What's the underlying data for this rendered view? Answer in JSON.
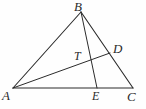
{
  "figure": {
    "kind": "geometry-diagram",
    "width": 146,
    "height": 109,
    "background_color": "#fefefe",
    "stroke_color": "#2b2b2b",
    "label_color": "#2b2b2b",
    "points": {
      "A": {
        "name": "A",
        "x": 13,
        "y": 88
      },
      "B": {
        "name": "B",
        "x": 81,
        "y": 12
      },
      "C": {
        "name": "C",
        "x": 133,
        "y": 88
      },
      "D": {
        "name": "D",
        "x": 110,
        "y": 53
      },
      "E": {
        "name": "E",
        "x": 97,
        "y": 88
      },
      "T": {
        "name": "T",
        "x": 90,
        "y": 62
      }
    },
    "segments": [
      {
        "name": "AB",
        "from": "A",
        "to": "B"
      },
      {
        "name": "BC",
        "from": "B",
        "to": "C"
      },
      {
        "name": "AC",
        "from": "A",
        "to": "C"
      },
      {
        "name": "BE",
        "from": "B",
        "to": "E"
      },
      {
        "name": "AD",
        "from": "A",
        "to": "D"
      }
    ],
    "labels": {
      "A": {
        "text": "A",
        "x": 2,
        "y": 89
      },
      "B": {
        "text": "B",
        "x": 74,
        "y": 0
      },
      "C": {
        "text": "C",
        "x": 127,
        "y": 90
      },
      "D": {
        "text": "D",
        "x": 113,
        "y": 42
      },
      "E": {
        "text": "E",
        "x": 92,
        "y": 90
      },
      "T": {
        "text": "T",
        "x": 74,
        "y": 50
      }
    }
  }
}
